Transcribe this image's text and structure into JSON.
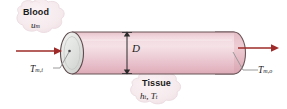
{
  "figure": {
    "name": "blood-vessel-heat-transfer-diagram",
    "background_color": "#ffffff"
  },
  "labels": {
    "blood": {
      "title": "Blood",
      "variable": "u",
      "variable_sub": "m"
    },
    "tissue": {
      "title": "Tissue",
      "variable_1": "h",
      "variable_1_sub": "t",
      "separator": ", ",
      "variable_2": "T",
      "variable_2_sub": "t"
    },
    "inlet_temperature": {
      "symbol": "T",
      "subscript": "m,i"
    },
    "outlet_temperature": {
      "symbol": "T",
      "subscript": "m,o"
    },
    "diameter": {
      "symbol": "D"
    }
  },
  "colors": {
    "vessel_fill_light": "#f3dbe0",
    "vessel_fill_mid": "#ecc6cf",
    "vessel_fill_dark": "#e0b0bc",
    "vessel_outline": "#6b5558",
    "endcap_fill": "#dfe0de",
    "arrow_red": "#9e2b29",
    "leader_gray": "#9a9a9a",
    "cloud_fill": "#f6eaed",
    "cloud_edge": "#e8d6da",
    "text": "#1a1a1a"
  },
  "icons": {
    "inlet_flow": "arrow-right-icon",
    "outlet_flow": "arrow-right-icon",
    "diameter_dimension": "double-arrow-vertical-icon",
    "blood_callout": "cloud-callout-icon",
    "tissue_callout": "cloud-callout-icon"
  }
}
